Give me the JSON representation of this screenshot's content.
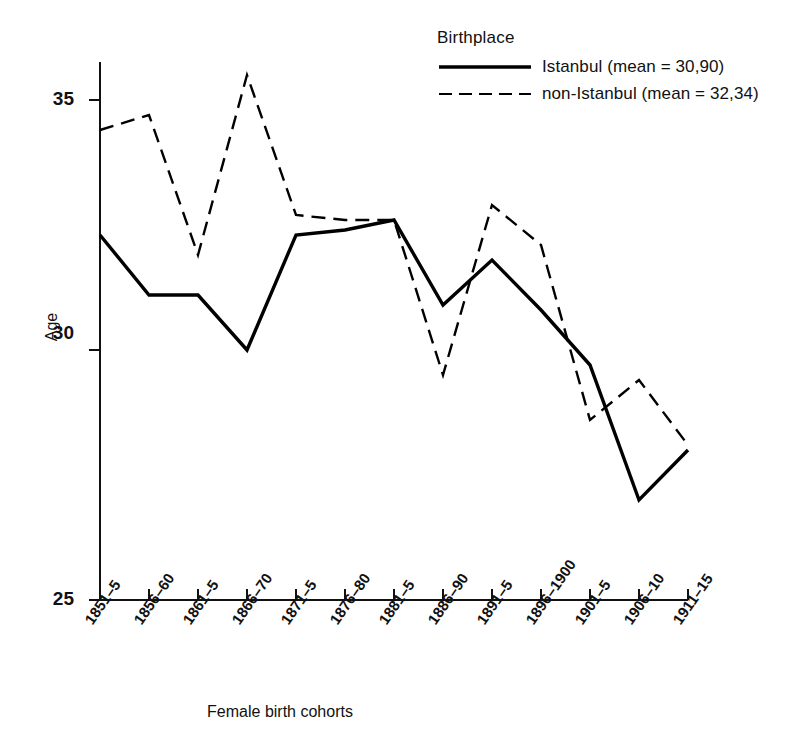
{
  "chart_data": {
    "type": "line",
    "title": "",
    "xlabel": "Female birth cohorts",
    "ylabel": "Age",
    "ylim": [
      25,
      35
    ],
    "yticks": [
      25,
      30,
      35
    ],
    "grid": false,
    "legend_position": "top-right",
    "legend_title": "Birthplace",
    "categories": [
      "1851–5",
      "1856–60",
      "1861–5",
      "1866–70",
      "1871–5",
      "1876–80",
      "1881–5",
      "1886–90",
      "1891–5",
      "1896–1900",
      "1901–5",
      "1906–10",
      "1911–15"
    ],
    "series": [
      {
        "name": "Istanbul (mean = 30,90)",
        "short_name": "Istanbul",
        "mean": "30,90",
        "style": "solid",
        "color": "#000000",
        "values": [
          32.3,
          31.1,
          31.1,
          30.0,
          32.3,
          32.4,
          32.6,
          30.9,
          31.8,
          30.8,
          29.7,
          27.0,
          28.0
        ]
      },
      {
        "name": "non-Istanbul (mean = 32,34)",
        "short_name": "non-Istanbul",
        "mean": "32,34",
        "style": "dashed",
        "color": "#000000",
        "values": [
          34.4,
          34.7,
          31.9,
          35.5,
          32.7,
          32.6,
          32.6,
          29.5,
          32.9,
          32.1,
          28.6,
          29.4,
          28.1
        ]
      }
    ]
  },
  "axis": {
    "y_tick_labels": [
      "25",
      "30",
      "35"
    ],
    "y_axis_title": "Age",
    "x_axis_title": "Female birth cohorts"
  },
  "legend": {
    "title": "Birthplace",
    "entries": [
      {
        "label": "Istanbul (mean = 30,90)",
        "style": "solid"
      },
      {
        "label": "non-Istanbul (mean = 32,34)",
        "style": "dashed"
      }
    ]
  }
}
